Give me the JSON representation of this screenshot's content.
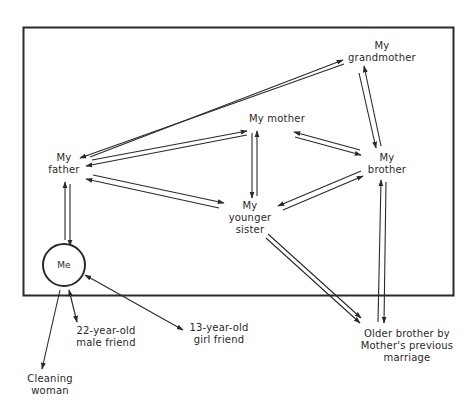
{
  "diagram": {
    "title": "",
    "colors": {
      "ink": "#2a2a2a",
      "background": "#ffffff"
    },
    "nodes": {
      "grandmother": {
        "line1": "My",
        "line2": "grandmother"
      },
      "mother": {
        "line1": "My mother"
      },
      "father": {
        "line1": "My",
        "line2": "father"
      },
      "brother": {
        "line1": "My",
        "line2": "brother"
      },
      "sister": {
        "line1": "My",
        "line2": "younger",
        "line3": "sister"
      },
      "me": {
        "line1": "Me"
      },
      "male_friend": {
        "line1": "22-year-old",
        "line2": "male friend"
      },
      "girl_friend": {
        "line1": "13-year-old",
        "line2": "girl friend"
      },
      "cleaning_woman": {
        "line1": "Cleaning",
        "line2": "woman"
      },
      "older_brother": {
        "line1": "Older brother by",
        "line2": "Mother's previous",
        "line3": "marriage"
      }
    },
    "edges": [
      {
        "from": "father",
        "to": "grandmother",
        "type": "double-arrow-pair"
      },
      {
        "from": "father",
        "to": "mother",
        "type": "double-arrow-pair"
      },
      {
        "from": "father",
        "to": "sister",
        "type": "double-arrow-pair"
      },
      {
        "from": "father",
        "to": "me",
        "type": "double-arrow-pair"
      },
      {
        "from": "mother",
        "to": "sister",
        "type": "double-arrow-pair"
      },
      {
        "from": "mother",
        "to": "brother",
        "type": "double-arrow-pair"
      },
      {
        "from": "grandmother",
        "to": "brother",
        "type": "double-arrow-pair"
      },
      {
        "from": "sister",
        "to": "brother",
        "type": "double-arrow-pair"
      },
      {
        "from": "sister",
        "to": "older_brother",
        "type": "one-way-pair"
      },
      {
        "from": "brother",
        "to": "older_brother",
        "type": "double-arrow-pair"
      },
      {
        "from": "me",
        "to": "male_friend",
        "type": "bidirectional-single"
      },
      {
        "from": "me",
        "to": "girl_friend",
        "type": "bidirectional-single"
      },
      {
        "from": "me",
        "to": "cleaning_woman",
        "type": "one-way-single"
      }
    ]
  }
}
